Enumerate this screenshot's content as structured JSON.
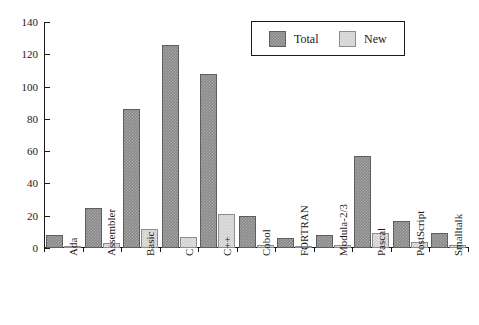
{
  "chart_data": {
    "type": "bar",
    "title": "",
    "subtitle": "",
    "xlabel": "",
    "ylabel": "",
    "ylim": [
      0,
      140
    ],
    "yticks": [
      0,
      20,
      40,
      60,
      80,
      100,
      120,
      140
    ],
    "grid": false,
    "legend_position": "top-right",
    "categories": [
      "Ada",
      "Assembler",
      "Basic",
      "C",
      "C++",
      "Cobol",
      "FORTRAN",
      "Modula-2/3",
      "Pascal",
      "PostScript",
      "Smalltalk"
    ],
    "series": [
      {
        "name": "Total",
        "color": "#8a8a8a",
        "values": [
          8,
          25,
          86,
          126,
          108,
          20,
          6,
          8,
          57,
          17,
          9
        ]
      },
      {
        "name": "New",
        "color": "#cfcfcf",
        "values": [
          1,
          3,
          12,
          7,
          21,
          2,
          1,
          2,
          9,
          4,
          2
        ]
      }
    ]
  },
  "legend": {
    "items": [
      {
        "label": "Total"
      },
      {
        "label": "New"
      }
    ]
  },
  "colors": {
    "total": "#8a8a8a",
    "new": "#cfcfcf",
    "axis": "#1a1a1a",
    "background": "#ffffff"
  }
}
